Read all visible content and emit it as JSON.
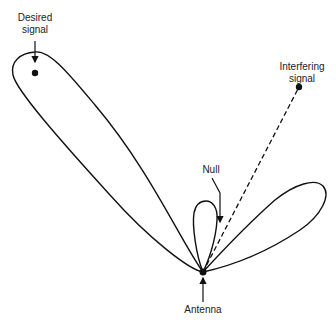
{
  "diagram": {
    "type": "antenna-radiation-pattern",
    "labels": {
      "desired_signal": [
        "Desired",
        "signal"
      ],
      "interfering_signal": [
        "Interfering",
        "signal"
      ],
      "null": "Null",
      "antenna": "Antenna"
    },
    "points": {
      "antenna": [
        203,
        272
      ],
      "desired_signal": [
        35,
        73
      ],
      "interfering_signal": [
        299,
        87
      ]
    },
    "colors": {
      "stroke": "#111111",
      "text": "#222222",
      "background": "#ffffff"
    }
  }
}
